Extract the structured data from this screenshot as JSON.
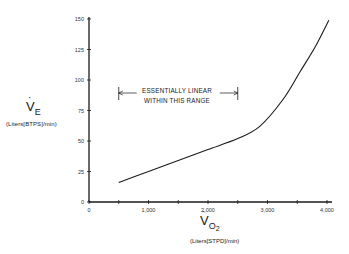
{
  "chart_data": {
    "type": "line",
    "title": "",
    "xlabel": "VO2",
    "xlabel_units": "(Liters[STPD]/min)",
    "ylabel": "VE",
    "ylabel_units": "(Liters[BTPS]/min)",
    "xlim": [
      0,
      4000
    ],
    "ylim": [
      0,
      150
    ],
    "x_ticks": [
      0,
      500,
      1000,
      1500,
      2000,
      2500,
      3000,
      3500,
      4000
    ],
    "x_tick_labels": [
      "0",
      "",
      "1,000",
      "",
      "2,000",
      "",
      "3,000",
      "",
      "4,000"
    ],
    "y_ticks": [
      0,
      25,
      50,
      75,
      100,
      125,
      150
    ],
    "y_tick_labels": [
      "0",
      "25",
      "50",
      "75",
      "100",
      "125",
      "150"
    ],
    "grid": false,
    "legend": null,
    "series": [
      {
        "name": "VE vs VO2",
        "x": [
          500,
          1000,
          1500,
          2000,
          2500,
          2870,
          3260,
          3550,
          3800,
          4030
        ],
        "y": [
          16,
          25,
          34,
          43,
          52,
          62,
          84,
          107,
          127,
          149
        ]
      }
    ],
    "annotations": [
      {
        "text_line1": "ESSENTIALLY LINEAR",
        "text_line2": "WITHIN THIS RANGE",
        "x_range": [
          500,
          2500
        ],
        "y": 86,
        "type": "double-arrow-bracket"
      }
    ]
  },
  "labels": {
    "y_main": "V",
    "y_sub": "E",
    "y_units": "(Liters[BTPS]/min)",
    "x_main": "V",
    "x_sub": "O",
    "x_subsub": "2",
    "x_units": "(Liters[STPD]/min)",
    "annot_line1": "ESSENTIALLY LINEAR",
    "annot_line2": "WITHIN THIS RANGE",
    "dot": "·"
  }
}
